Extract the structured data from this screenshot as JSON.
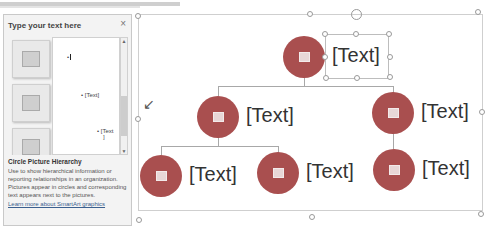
{
  "text_pane": {
    "title": "Type your text here",
    "close_icon": "×",
    "items": [
      {
        "level": 1,
        "text": ""
      },
      {
        "level": 2,
        "text": "[Text]"
      },
      {
        "level": 3,
        "text": "[Text"
      },
      {
        "level": 3,
        "text_cont": "]"
      }
    ],
    "description": {
      "title": "Circle Picture Hierarchy",
      "body": "Use to show hierarchical information or reporting relationships in an organization. Pictures appear in circles and corresponding text appears next to the pictures.",
      "link": "Learn more about SmartArt graphics"
    }
  },
  "smartart": {
    "accent_color": "#a94f4f",
    "nodes": [
      {
        "id": "root",
        "label": "[Text]"
      },
      {
        "id": "left",
        "label": "[Text]"
      },
      {
        "id": "right",
        "label": "[Text]"
      },
      {
        "id": "left-child-1",
        "label": "[Text]"
      },
      {
        "id": "left-child-2",
        "label": "[Text]"
      },
      {
        "id": "right-child-1",
        "label": "[Text]"
      }
    ]
  }
}
